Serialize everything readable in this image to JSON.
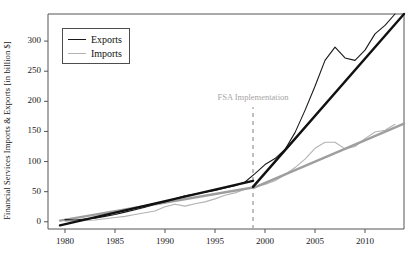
{
  "chart_data": {
    "type": "line",
    "title": "",
    "xlabel": "",
    "ylabel": "Financial Services Imports & Exports [in billion $]",
    "xlim": [
      1978.3,
      2013.9
    ],
    "ylim": [
      -12,
      345
    ],
    "grid": false,
    "legend_position": "top-left",
    "xticks": [
      1980,
      1985,
      1990,
      1995,
      2000,
      2005,
      2010
    ],
    "xtick_labels": [
      "1980",
      "1985",
      "1990",
      "1995",
      "2000",
      "2005",
      "2010"
    ],
    "yticks": [
      0,
      50,
      100,
      150,
      200,
      250,
      300
    ],
    "ytick_labels": [
      "0",
      "50",
      "100",
      "150",
      "200",
      "250",
      "300"
    ],
    "series": [
      {
        "name": "Exports",
        "color": "#1a1a1a",
        "style": "solid",
        "width": 1.1,
        "x": [
          1980,
          1981,
          1982,
          1983,
          1984,
          1985,
          1986,
          1987,
          1988,
          1989,
          1990,
          1991,
          1992,
          1993,
          1994,
          1995,
          1996,
          1997,
          1998,
          1999,
          2000,
          2001,
          2002,
          2003,
          2004,
          2005,
          2006,
          2007,
          2008,
          2009,
          2010,
          2011,
          2012,
          2013
        ],
        "values": [
          3.5,
          3.0,
          4.5,
          6.0,
          9.0,
          12.0,
          16.0,
          20.0,
          24.0,
          29.0,
          33.0,
          38.0,
          43.0,
          46.0,
          49.0,
          52.0,
          56.0,
          60.0,
          66.0,
          80.0,
          95.0,
          105.0,
          120.0,
          148.0,
          185.0,
          225.0,
          268.0,
          290.0,
          272.0,
          268.0,
          285.0,
          312.0,
          326.0,
          345.0
        ]
      },
      {
        "name": "Exports trend",
        "color": "#111111",
        "style": "solid",
        "width": 2.4,
        "segments": [
          {
            "x": [
              1979.5,
              1998.8
            ],
            "values": [
              -6.0,
              68.0
            ]
          },
          {
            "x": [
              1998.8,
              2013.9
            ],
            "values": [
              58.0,
              345.0
            ]
          }
        ]
      },
      {
        "name": "Imports",
        "color": "#b3b3b3",
        "style": "solid",
        "width": 1.1,
        "x": [
          1980,
          1981,
          1982,
          1983,
          1984,
          1985,
          1986,
          1987,
          1988,
          1989,
          1990,
          1991,
          1992,
          1993,
          1994,
          1995,
          1996,
          1997,
          1998,
          1999,
          2000,
          2001,
          2002,
          2003,
          2004,
          2005,
          2006,
          2007,
          2008,
          2009,
          2010,
          2011,
          2012,
          2013
        ],
        "values": [
          1.0,
          1.0,
          2.0,
          3.0,
          5.0,
          7.0,
          9.0,
          12.0,
          15.0,
          18.0,
          25.0,
          29.0,
          26.0,
          30.0,
          33.0,
          38.0,
          44.0,
          48.0,
          54.0,
          58.0,
          62.0,
          68.0,
          78.0,
          90.0,
          104.0,
          122.0,
          132.0,
          132.0,
          121.0,
          125.0,
          138.0,
          149.0,
          152.0,
          162.0
        ]
      },
      {
        "name": "Imports trend",
        "color": "#9e9e9e",
        "style": "solid",
        "width": 2.4,
        "segments": [
          {
            "x": [
              1979.5,
              1998.8
            ],
            "values": [
              2.0,
              57.0
            ]
          },
          {
            "x": [
              1998.8,
              2013.9
            ],
            "values": [
              56.0,
              163.0
            ]
          }
        ]
      }
    ],
    "legend": [
      {
        "label": "Exports",
        "color": "#1a1a1a"
      },
      {
        "label": "Imports",
        "color": "#b3b3b3"
      }
    ],
    "annotations": [
      {
        "text": "FSA Implementation",
        "x": 1998.8,
        "y": 205,
        "color": "#a6a6a6",
        "vline": {
          "x": 1998.8,
          "y_from": -12,
          "y_to": 190,
          "style": "dashed",
          "color": "#a6a6a6"
        }
      }
    ]
  }
}
